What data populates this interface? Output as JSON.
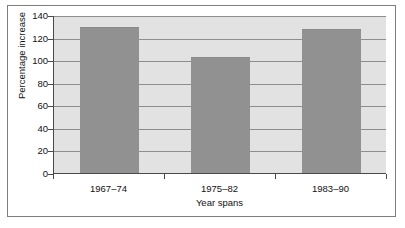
{
  "chart_data": {
    "type": "bar",
    "title": "",
    "categories": [
      "1967–74",
      "1975–82",
      "1983–90"
    ],
    "values": [
      129,
      102.5,
      128
    ],
    "xlabel": "Year spans",
    "ylabel": "Percentage increase",
    "ylim": [
      0,
      140
    ],
    "ytick_labels": [
      "0",
      "20",
      "40",
      "60",
      "80",
      "100",
      "120",
      "140"
    ],
    "ytick_values": [
      0,
      20,
      40,
      60,
      80,
      100,
      120,
      140
    ],
    "grid": "horizontal",
    "legend": "none",
    "colors": {
      "bar_fill": "#919191",
      "plot_background": "#e2e2e2",
      "gridline": "#8e8e8e",
      "axis_line": "#4a4a4a",
      "frame_border": "#7d7d7d",
      "page_background": "#ffffff",
      "text": "#111111"
    }
  }
}
